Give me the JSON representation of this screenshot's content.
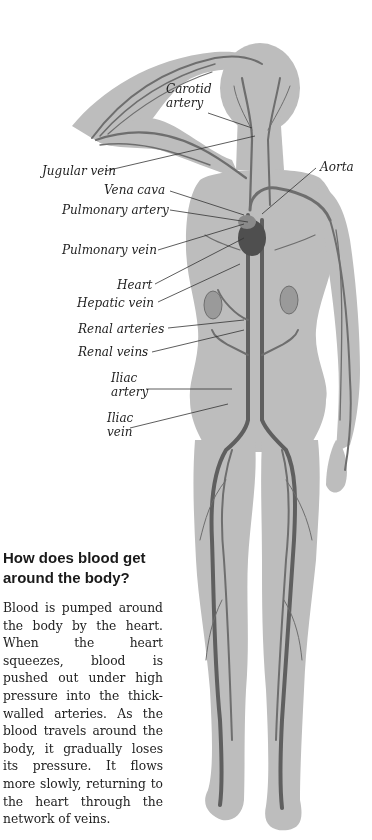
{
  "diagram": {
    "colors": {
      "body_fill": "#b9b9b9",
      "vessel": "#6e6e6e",
      "vessel_dark": "#555555",
      "leader_line": "#333333",
      "text": "#1e1e1e"
    },
    "labels": [
      {
        "id": "carotid",
        "text": "Carotid artery",
        "lines": [
          "Carotid",
          "artery"
        ]
      },
      {
        "id": "aorta",
        "text": "Aorta"
      },
      {
        "id": "jugular",
        "text": "Jugular vein"
      },
      {
        "id": "vena_cava",
        "text": "Vena cava"
      },
      {
        "id": "pulmonary_artery",
        "text": "Pulmonary artery"
      },
      {
        "id": "pulmonary_vein",
        "text": "Pulmonary vein"
      },
      {
        "id": "heart",
        "text": "Heart"
      },
      {
        "id": "hepatic_vein",
        "text": "Hepatic vein"
      },
      {
        "id": "renal_arteries",
        "text": "Renal arteries"
      },
      {
        "id": "renal_veins",
        "text": "Renal veins"
      },
      {
        "id": "iliac_artery",
        "text": "Iliac artery",
        "lines": [
          "Iliac",
          "artery"
        ]
      },
      {
        "id": "iliac_vein",
        "text": "Iliac vein",
        "lines": [
          "Iliac",
          "vein"
        ]
      }
    ]
  },
  "sidebar": {
    "heading": "How does blood get around the body?",
    "body": "Blood is pumped around the body by the heart. When the heart squeezes, blood is pushed out under high pressure into the thick-walled arteries. As the blood travels around the body, it gradually loses its pressure. It flows more slowly, returning to the heart through the network of veins."
  }
}
